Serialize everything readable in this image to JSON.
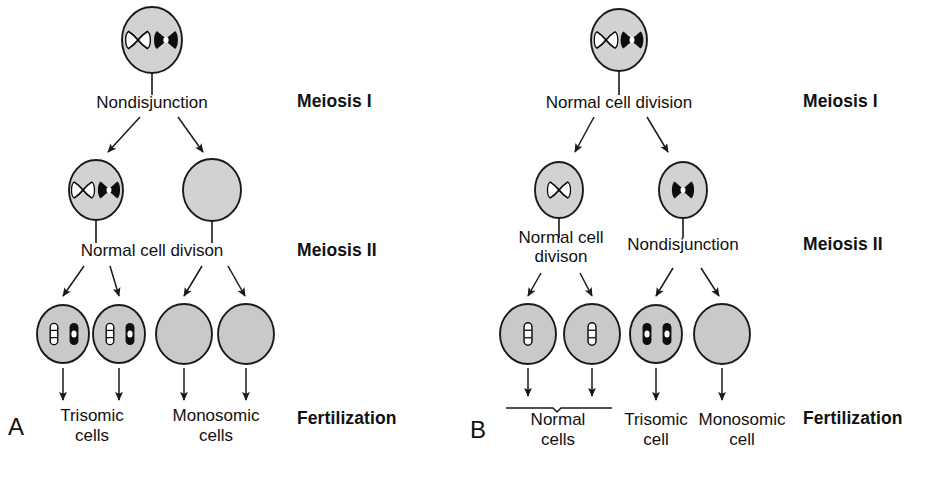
{
  "figure": {
    "background_color": "#ffffff",
    "cell_fill_color": "#d2d2d2",
    "cell_stroke_color": "#1a1a1a",
    "chromosome_black": "#0d0d0d",
    "chromosome_white": "#ffffff",
    "line_color": "#1a1a1a"
  },
  "stage_labels": [
    {
      "id": "meiosis-i",
      "label": "Meiosis I"
    },
    {
      "id": "meiosis-ii",
      "label": "Meiosis II"
    },
    {
      "id": "fertilization",
      "label": "Fertilization"
    }
  ],
  "panels": [
    {
      "id": "panel-a",
      "letter": "A",
      "caption": "Nondisjunction in Meiosis I",
      "meiosis_i_process": "Nondisjunction",
      "meiosis_ii_process": "Normal cell divison",
      "parent_cell": {
        "name": "parent-cell",
        "chromosomes": [
          "white-x",
          "black-x"
        ]
      },
      "meiosis_i_products": [
        {
          "name": "meiosis-i-cell-left",
          "chromosomes": [
            "white-x",
            "black-x"
          ]
        },
        {
          "name": "meiosis-i-cell-right",
          "chromosomes": []
        }
      ],
      "gametes": [
        {
          "name": "gamete-1",
          "chromosomes": [
            "white-rod",
            "black-rod"
          ],
          "outcome": "trisomic"
        },
        {
          "name": "gamete-2",
          "chromosomes": [
            "white-rod",
            "black-rod"
          ],
          "outcome": "trisomic"
        },
        {
          "name": "gamete-3",
          "chromosomes": [],
          "outcome": "monosomic"
        },
        {
          "name": "gamete-4",
          "chromosomes": [],
          "outcome": "monosomic"
        }
      ],
      "outcome_labels": [
        {
          "name": "outcome-trisomic",
          "line1": "Trisomic",
          "line2": "cells"
        },
        {
          "name": "outcome-monosomic",
          "line1": "Monosomic",
          "line2": "cells"
        }
      ]
    },
    {
      "id": "panel-b",
      "letter": "B",
      "caption": "Nondisjunction in Meiosis II",
      "meiosis_i_process": "Normal cell division",
      "meiosis_ii_process_left": "Normal cell\ndivison",
      "meiosis_ii_process_right": "Nondisjunction",
      "parent_cell": {
        "name": "parent-cell",
        "chromosomes": [
          "white-x",
          "black-x"
        ]
      },
      "meiosis_i_products": [
        {
          "name": "meiosis-i-cell-left",
          "chromosomes": [
            "white-x"
          ]
        },
        {
          "name": "meiosis-i-cell-right",
          "chromosomes": [
            "black-x"
          ]
        }
      ],
      "gametes": [
        {
          "name": "gamete-1",
          "chromosomes": [
            "white-rod"
          ],
          "outcome": "normal"
        },
        {
          "name": "gamete-2",
          "chromosomes": [
            "white-rod"
          ],
          "outcome": "normal"
        },
        {
          "name": "gamete-3",
          "chromosomes": [
            "black-rod",
            "black-rod"
          ],
          "outcome": "trisomic"
        },
        {
          "name": "gamete-4",
          "chromosomes": [],
          "outcome": "monosomic"
        }
      ],
      "outcome_labels": [
        {
          "name": "outcome-normal",
          "line1": "Normal",
          "line2": "cells"
        },
        {
          "name": "outcome-trisomic",
          "line1": "Trisomic",
          "line2": "cell"
        },
        {
          "name": "outcome-monosomic",
          "line1": "Monosomic",
          "line2": "cell"
        }
      ]
    }
  ]
}
